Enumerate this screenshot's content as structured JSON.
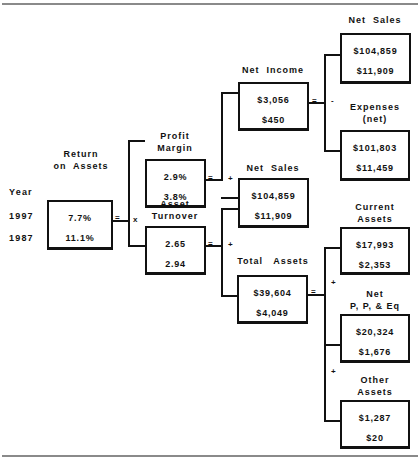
{
  "years": {
    "header": "Year",
    "rows": [
      "1997",
      "1987"
    ]
  },
  "nodes": {
    "roa": {
      "label": "Return\non  Assets",
      "values": [
        "7.7%",
        "11.1%"
      ]
    },
    "profit_margin": {
      "label": "Profit\nMargin",
      "values": [
        "2.9%",
        "3.8%"
      ]
    },
    "asset_turnover": {
      "label": "Asset\nTurnover",
      "values": [
        "2.65",
        "2.94"
      ]
    },
    "net_income": {
      "label": "Net  Income",
      "values": [
        "$3,056",
        "$450"
      ]
    },
    "net_sales_mid": {
      "label": "Net  Sales",
      "values": [
        "$104,859",
        "$11,909"
      ]
    },
    "total_assets": {
      "label": "Total   Assets",
      "values": [
        "$39,604",
        "$4,049"
      ]
    },
    "net_sales_top": {
      "label": "Net  Sales",
      "values": [
        "$104,859",
        "$11,909"
      ]
    },
    "expenses": {
      "label": "Expenses\n(net)",
      "values": [
        "$101,803",
        "$11,459"
      ]
    },
    "current_assets": {
      "label": "Current\nAssets",
      "values": [
        "$17,993",
        "$2,353"
      ]
    },
    "net_ppe": {
      "label": "Net\nP, P, & Eq",
      "values": [
        "$20,324",
        "$1,676"
      ]
    },
    "other_assets": {
      "label": "Other\nAssets",
      "values": [
        "$1,287",
        "$20"
      ]
    }
  },
  "operators": {
    "equals": "=",
    "times": "x",
    "plus": "+",
    "minus": "-",
    "divide": "÷"
  }
}
